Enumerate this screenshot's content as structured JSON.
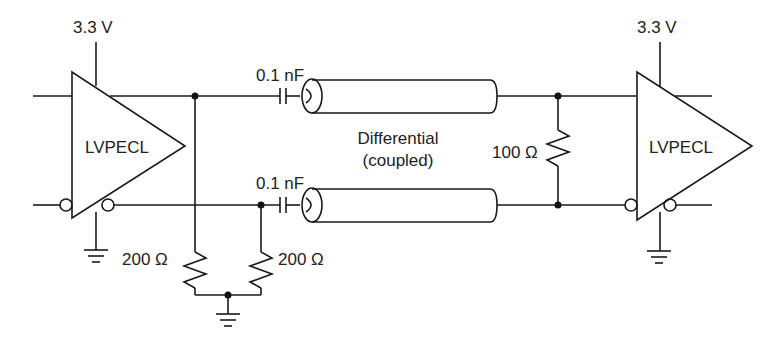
{
  "diagram": {
    "type": "circuit-schematic",
    "driver": {
      "label": "LVPECL",
      "supply_label": "3.3 V"
    },
    "receiver": {
      "label": "LVPECL",
      "supply_label": "3.3 V"
    },
    "coupling_capacitors": [
      {
        "label": "0.1 nF"
      },
      {
        "label": "0.1 nF"
      }
    ],
    "bias_resistors": [
      {
        "label": "200 Ω"
      },
      {
        "label": "200 Ω"
      }
    ],
    "termination_resistor": {
      "label": "100 Ω"
    },
    "transmission_line": {
      "label_line1": "Differential",
      "label_line2": "(coupled)"
    }
  }
}
